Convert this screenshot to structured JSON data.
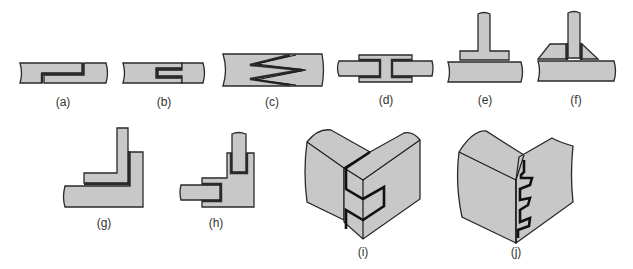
{
  "figure": {
    "fill_color": "#c8c8c8",
    "stroke_color": "#2a2a2a",
    "panels": [
      {
        "id": "a",
        "label": "(a)",
        "type": "lap joint (stepped)"
      },
      {
        "id": "b",
        "label": "(b)",
        "type": "tongue-and-groove joint"
      },
      {
        "id": "c",
        "label": "(c)",
        "type": "scarf / finger joint"
      },
      {
        "id": "d",
        "label": "(d)",
        "type": "double strap / sleeve joint"
      },
      {
        "id": "e",
        "label": "(e)",
        "type": "T joint"
      },
      {
        "id": "f",
        "label": "(f)",
        "type": "T joint with gussets"
      },
      {
        "id": "g",
        "label": "(g)",
        "type": "corner joint with angle"
      },
      {
        "id": "h",
        "label": "(h)",
        "type": "corner block joint"
      },
      {
        "id": "i",
        "label": "(i)",
        "type": "3D corner box joint"
      },
      {
        "id": "j",
        "label": "(j)",
        "type": "3D dovetail corner joint"
      }
    ]
  }
}
